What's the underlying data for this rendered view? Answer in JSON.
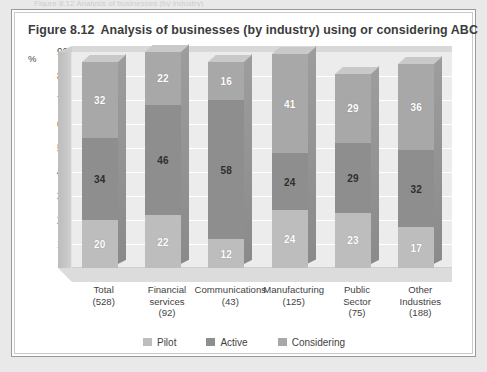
{
  "page": {
    "cut_off_top_text": "Figure 8.12  Analysis of businesses (by industry)"
  },
  "figure": {
    "number_label": "Figure 8.12",
    "title": "Analysis of businesses (by industry) using or considering ABC"
  },
  "chart_data": {
    "type": "bar",
    "subtype": "stacked-column-3d",
    "xlabel": "",
    "ylabel": "%",
    "ylim": [
      0,
      90
    ],
    "yticks": [
      10,
      20,
      30,
      40,
      50,
      60,
      70,
      80,
      90
    ],
    "grid": true,
    "legend_position": "bottom",
    "categories": [
      "Total",
      "Financial services",
      "Communications",
      "Manufacturing",
      "Public Sector",
      "Other Industries"
    ],
    "category_lines": [
      [
        "Total",
        "(528)"
      ],
      [
        "Financial",
        "services",
        "(92)"
      ],
      [
        "Communications",
        "(43)"
      ],
      [
        "Manufacturing",
        "(125)"
      ],
      [
        "Public",
        "Sector",
        "(75)"
      ],
      [
        "Other",
        "Industries",
        "(188)"
      ]
    ],
    "sample_sizes": [
      528,
      92,
      43,
      125,
      75,
      188
    ],
    "series": [
      {
        "name": "Pilot",
        "color": "#bdbdbd",
        "values": [
          20,
          22,
          12,
          24,
          23,
          17
        ]
      },
      {
        "name": "Active",
        "color": "#8e8e8e",
        "values": [
          34,
          46,
          58,
          24,
          29,
          32
        ]
      },
      {
        "name": "Considering",
        "color": "#a8a8a8",
        "values": [
          32,
          22,
          16,
          41,
          29,
          36
        ]
      }
    ],
    "totals": [
      86,
      90,
      86,
      89,
      81,
      85
    ]
  },
  "colors": {
    "plot_background": "#ececec",
    "gridline": "#ffffff",
    "wall": "#c6c6c6",
    "floor": "#dcdcdc",
    "frame_border": "#9a9a9a",
    "title_text": "#3b3b3b"
  }
}
